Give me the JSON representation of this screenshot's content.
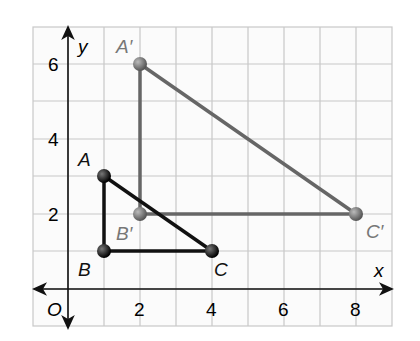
{
  "axes": {
    "x_label": "x",
    "y_label": "y",
    "origin_label": "O",
    "x_ticks": [
      "2",
      "4",
      "6",
      "8"
    ],
    "y_ticks": [
      "2",
      "4",
      "6"
    ]
  },
  "triangles": {
    "original": {
      "color": "#111111",
      "points": [
        {
          "label": "A",
          "x": 1,
          "y": 3
        },
        {
          "label": "B",
          "x": 1,
          "y": 1
        },
        {
          "label": "C",
          "x": 4,
          "y": 1
        }
      ]
    },
    "image": {
      "color": "#666666",
      "points": [
        {
          "label": "A′",
          "x": 2,
          "y": 6
        },
        {
          "label": "B′",
          "x": 2,
          "y": 2
        },
        {
          "label": "C′",
          "x": 8,
          "y": 2
        }
      ]
    }
  }
}
